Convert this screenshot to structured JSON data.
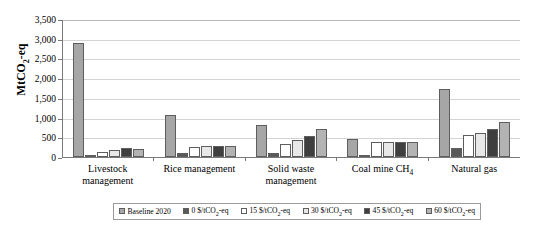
{
  "chart_data": {
    "type": "bar",
    "title": "",
    "xlabel": "",
    "ylabel": "MtCO2-eq",
    "ylim": [
      0,
      3500
    ],
    "ytick_step": 500,
    "yticks": [
      "0",
      "500",
      "1,000",
      "1,500",
      "2,000",
      "2,500",
      "3,000",
      "3,500"
    ],
    "grid": true,
    "legend_position": "bottom",
    "categories": [
      "Livestock management",
      "Rice management",
      "Solid waste management",
      "Coal mine CH4",
      "Natural gas"
    ],
    "series": [
      {
        "name": "Baseline 2020",
        "color": "#a6a6a6",
        "values": [
          2880,
          1060,
          820,
          460,
          1730
        ]
      },
      {
        "name": "0 $/tCO2-eq",
        "color": "#595959",
        "values": [
          60,
          90,
          110,
          50,
          230
        ]
      },
      {
        "name": "15 $/tCO2-eq",
        "color": "#ffffff",
        "values": [
          130,
          250,
          330,
          370,
          560
        ]
      },
      {
        "name": "30 $/tCO2-eq",
        "color": "#e8e8e8",
        "values": [
          170,
          270,
          430,
          380,
          620
        ]
      },
      {
        "name": "45 $/tCO2-eq",
        "color": "#3f3f3f",
        "values": [
          220,
          280,
          530,
          390,
          700
        ]
      },
      {
        "name": "60 $/tCO2-eq",
        "color": "#b3b3b3",
        "values": [
          200,
          290,
          720,
          390,
          900
        ]
      }
    ]
  },
  "axis": {
    "y_title_main": "MtCO",
    "y_title_sub": "2",
    "y_title_tail": "-eq"
  },
  "categories_display": [
    {
      "main": "Livestock management",
      "sub": "",
      "tail": ""
    },
    {
      "main": "Rice management",
      "sub": "",
      "tail": ""
    },
    {
      "main": "Solid waste management",
      "sub": "",
      "tail": ""
    },
    {
      "main": "Coal mine CH",
      "sub": "4",
      "tail": ""
    },
    {
      "main": "Natural gas",
      "sub": "",
      "tail": ""
    }
  ],
  "legend": {
    "items": [
      {
        "prefix": "Baseline 2020",
        "sub": "",
        "tail": ""
      },
      {
        "prefix": "0 $/tCO",
        "sub": "2",
        "tail": "-eq"
      },
      {
        "prefix": "15 $/tCO",
        "sub": "2",
        "tail": "-eq"
      },
      {
        "prefix": "30 $/tCO",
        "sub": "2",
        "tail": "-eq"
      },
      {
        "prefix": "45  $/tCO",
        "sub": "2",
        "tail": "-eq"
      },
      {
        "prefix": "60 $/tCO",
        "sub": "2",
        "tail": "-eq"
      }
    ]
  }
}
